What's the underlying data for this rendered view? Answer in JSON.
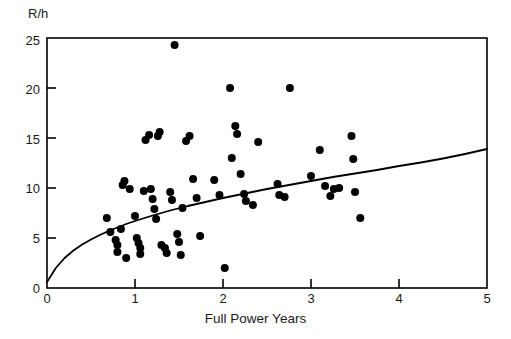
{
  "chart_data": {
    "type": "scatter",
    "title": "",
    "xlabel": "Full Power Years",
    "ylabel": "R/h",
    "xlim": [
      0,
      5
    ],
    "ylim": [
      0,
      25
    ],
    "grid": false,
    "legend": null,
    "xticks": [
      0,
      1,
      2,
      3,
      4,
      5
    ],
    "xtick_labels": [
      "0",
      "1",
      "2",
      "3",
      "4",
      "5"
    ],
    "yticks": [
      0,
      5,
      10,
      15,
      20,
      25
    ],
    "ytick_labels": [
      "0",
      "5",
      "10",
      "15",
      "20",
      "25"
    ],
    "marker": "filled-circle",
    "marker_color": "#000000",
    "marker_size_px": 8,
    "points": [
      [
        0.68,
        7.0
      ],
      [
        0.72,
        5.6
      ],
      [
        0.78,
        4.8
      ],
      [
        0.8,
        4.3
      ],
      [
        0.8,
        3.6
      ],
      [
        0.84,
        5.9
      ],
      [
        0.86,
        10.3
      ],
      [
        0.88,
        10.7
      ],
      [
        0.9,
        3.0
      ],
      [
        0.94,
        9.9
      ],
      [
        1.0,
        7.2
      ],
      [
        1.02,
        5.0
      ],
      [
        1.04,
        4.5
      ],
      [
        1.06,
        4.0
      ],
      [
        1.06,
        3.4
      ],
      [
        1.1,
        9.7
      ],
      [
        1.12,
        14.8
      ],
      [
        1.16,
        15.3
      ],
      [
        1.18,
        9.9
      ],
      [
        1.2,
        8.9
      ],
      [
        1.22,
        7.9
      ],
      [
        1.24,
        6.9
      ],
      [
        1.26,
        15.2
      ],
      [
        1.28,
        15.6
      ],
      [
        1.3,
        4.3
      ],
      [
        1.34,
        4.0
      ],
      [
        1.36,
        3.5
      ],
      [
        1.4,
        9.6
      ],
      [
        1.42,
        8.8
      ],
      [
        1.45,
        24.3
      ],
      [
        1.48,
        5.4
      ],
      [
        1.5,
        4.6
      ],
      [
        1.52,
        3.3
      ],
      [
        1.54,
        8.0
      ],
      [
        1.58,
        14.7
      ],
      [
        1.62,
        15.2
      ],
      [
        1.66,
        10.9
      ],
      [
        1.7,
        9.0
      ],
      [
        1.74,
        5.2
      ],
      [
        1.9,
        10.8
      ],
      [
        1.96,
        9.3
      ],
      [
        2.02,
        2.0
      ],
      [
        2.08,
        20.0
      ],
      [
        2.1,
        13.0
      ],
      [
        2.14,
        16.2
      ],
      [
        2.16,
        15.4
      ],
      [
        2.2,
        11.4
      ],
      [
        2.24,
        9.4
      ],
      [
        2.26,
        8.7
      ],
      [
        2.34,
        8.3
      ],
      [
        2.4,
        14.6
      ],
      [
        2.62,
        10.4
      ],
      [
        2.64,
        9.3
      ],
      [
        2.7,
        9.1
      ],
      [
        2.76,
        20.0
      ],
      [
        3.0,
        11.2
      ],
      [
        3.1,
        13.8
      ],
      [
        3.16,
        10.2
      ],
      [
        3.22,
        9.2
      ],
      [
        3.26,
        9.9
      ],
      [
        3.32,
        10.0
      ],
      [
        3.46,
        15.2
      ],
      [
        3.48,
        12.9
      ],
      [
        3.5,
        9.6
      ],
      [
        3.56,
        7.0
      ]
    ],
    "fit_curve": {
      "name": "power-law trend",
      "color": "#000000",
      "width_px": 1.8,
      "description": "monotonic concave curve rising from about 0.6 at x=0 to about 13.9 at x=5",
      "points": [
        [
          0.0,
          0.6
        ],
        [
          0.1,
          2.0
        ],
        [
          0.2,
          3.0
        ],
        [
          0.3,
          3.75
        ],
        [
          0.4,
          4.35
        ],
        [
          0.5,
          4.85
        ],
        [
          0.6,
          5.3
        ],
        [
          0.7,
          5.7
        ],
        [
          0.8,
          6.05
        ],
        [
          0.9,
          6.4
        ],
        [
          1.0,
          6.7
        ],
        [
          1.2,
          7.25
        ],
        [
          1.4,
          7.75
        ],
        [
          1.6,
          8.2
        ],
        [
          1.8,
          8.6
        ],
        [
          2.0,
          9.0
        ],
        [
          2.25,
          9.45
        ],
        [
          2.5,
          9.9
        ],
        [
          2.75,
          10.3
        ],
        [
          3.0,
          10.7
        ],
        [
          3.25,
          11.1
        ],
        [
          3.5,
          11.45
        ],
        [
          3.75,
          11.8
        ],
        [
          4.0,
          12.2
        ],
        [
          4.25,
          12.55
        ],
        [
          4.5,
          12.95
        ],
        [
          4.75,
          13.4
        ],
        [
          5.0,
          13.9
        ]
      ]
    }
  },
  "axes": {
    "frame_color": "#000000",
    "plot_left_px": 47,
    "plot_right_px": 487,
    "plot_top_px": 38,
    "plot_bottom_px": 288
  }
}
